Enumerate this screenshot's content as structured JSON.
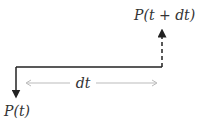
{
  "diagram": {
    "labels": {
      "start": "P(t)",
      "end": "P(t + dt)",
      "interval": "dt"
    },
    "colors": {
      "main_line": "#222222",
      "dimension_line": "#bbbbbb",
      "text": "#333333"
    }
  }
}
